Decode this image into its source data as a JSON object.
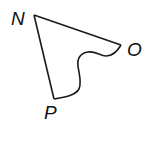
{
  "diagram": {
    "type": "geometric-figure",
    "vertices": [
      {
        "label": "N",
        "x": 34,
        "y": 15
      },
      {
        "label": "O",
        "x": 121,
        "y": 45
      },
      {
        "label": "P",
        "x": 54,
        "y": 99
      }
    ],
    "edges": [
      {
        "from": "N",
        "to": "O",
        "kind": "straight"
      },
      {
        "from": "N",
        "to": "P",
        "kind": "straight"
      },
      {
        "from": "O",
        "to": "P",
        "kind": "curved"
      }
    ],
    "stroke_color": "#1a1a1a",
    "labels": {
      "n": "N",
      "o": "O",
      "p": "P"
    }
  }
}
